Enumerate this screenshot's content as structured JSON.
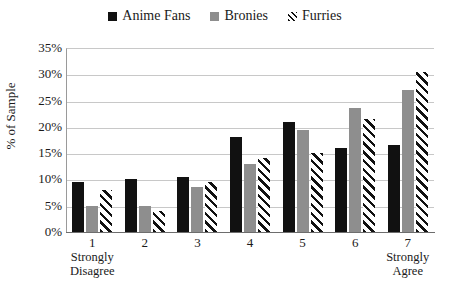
{
  "chart_data": {
    "type": "bar",
    "title": "",
    "xlabel": "",
    "ylabel": "% of Sample",
    "ylim": [
      0,
      35
    ],
    "ytick_labels": [
      "35%",
      "30%",
      "25%",
      "20%",
      "15%",
      "10%",
      "5%",
      "0%"
    ],
    "ytick_values": [
      35,
      30,
      25,
      20,
      15,
      10,
      5,
      0
    ],
    "grid": true,
    "legend_position": "top-center",
    "categories": [
      "1",
      "2",
      "3",
      "4",
      "5",
      "6",
      "7"
    ],
    "category_anchors": {
      "first": [
        "Strongly",
        "Disagree"
      ],
      "last": [
        "Strongly",
        "Agree"
      ]
    },
    "series": [
      {
        "name": "Anime Fans",
        "fill": "solid-black",
        "color": "#111111",
        "values": [
          9.5,
          10.0,
          10.5,
          18.0,
          21.0,
          16.0,
          16.5
        ]
      },
      {
        "name": "Bronies",
        "fill": "solid-gray",
        "color": "#8e8e8e",
        "values": [
          5.0,
          5.0,
          8.5,
          13.0,
          19.5,
          23.5,
          27.0
        ]
      },
      {
        "name": "Furries",
        "fill": "diagonal-hatch",
        "color": "#111111",
        "values": [
          8.0,
          4.0,
          9.5,
          14.0,
          15.0,
          21.5,
          30.5
        ]
      }
    ]
  }
}
